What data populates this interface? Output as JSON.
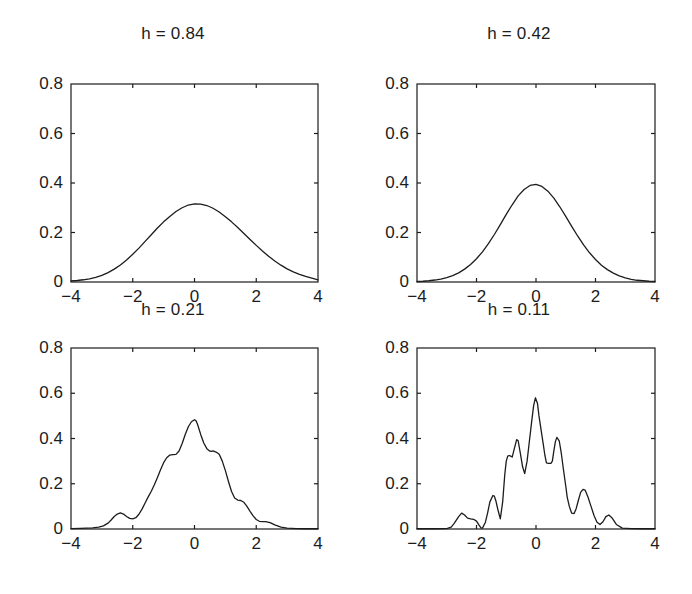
{
  "figure": {
    "width": 692,
    "height": 594,
    "background": "#ffffff",
    "axis_color": "#1c1c1c",
    "curve_color": "#1c1c1c"
  },
  "chart_data": [
    {
      "type": "line",
      "title": "h = 0.84",
      "xlabel": "",
      "ylabel": "",
      "xlim": [
        -4,
        4
      ],
      "ylim": [
        0,
        0.8
      ],
      "xticks": [
        -4,
        -2,
        0,
        2,
        4
      ],
      "xticklabels": [
        "−4",
        "−2",
        "0",
        "2",
        "4"
      ],
      "yticks": [
        0,
        0.2,
        0.4,
        0.6,
        0.8
      ],
      "yticklabels": [
        "0",
        "0.2",
        "0.4",
        "0.6",
        "0.8"
      ],
      "grid": false,
      "legend": null,
      "series": [
        {
          "name": "kde h=0.84",
          "x": [
            -4.0,
            -3.8,
            -3.6,
            -3.4,
            -3.2,
            -3.0,
            -2.8,
            -2.6,
            -2.4,
            -2.2,
            -2.0,
            -1.8,
            -1.6,
            -1.4,
            -1.2,
            -1.0,
            -0.8,
            -0.6,
            -0.4,
            -0.2,
            0.0,
            0.2,
            0.4,
            0.6,
            0.8,
            1.0,
            1.2,
            1.4,
            1.6,
            1.8,
            2.0,
            2.2,
            2.4,
            2.6,
            2.8,
            3.0,
            3.2,
            3.4,
            3.6,
            3.8,
            4.0
          ],
          "y": [
            0.004,
            0.006,
            0.009,
            0.013,
            0.019,
            0.027,
            0.038,
            0.052,
            0.069,
            0.089,
            0.112,
            0.137,
            0.164,
            0.191,
            0.218,
            0.243,
            0.265,
            0.285,
            0.3,
            0.311,
            0.316,
            0.315,
            0.309,
            0.298,
            0.283,
            0.264,
            0.243,
            0.22,
            0.196,
            0.172,
            0.148,
            0.125,
            0.104,
            0.085,
            0.068,
            0.053,
            0.041,
            0.031,
            0.023,
            0.016,
            0.009
          ]
        }
      ]
    },
    {
      "type": "line",
      "title": "h = 0.42",
      "xlabel": "",
      "ylabel": "",
      "xlim": [
        -4,
        4
      ],
      "ylim": [
        0,
        0.8
      ],
      "xticks": [
        -4,
        -2,
        0,
        2,
        4
      ],
      "xticklabels": [
        "−4",
        "−2",
        "0",
        "2",
        "4"
      ],
      "yticks": [
        0,
        0.2,
        0.4,
        0.6,
        0.8
      ],
      "yticklabels": [
        "0",
        "0.2",
        "0.4",
        "0.6",
        "0.8"
      ],
      "grid": false,
      "legend": null,
      "series": [
        {
          "name": "kde h=0.42",
          "x": [
            -4.0,
            -3.8,
            -3.6,
            -3.4,
            -3.2,
            -3.0,
            -2.8,
            -2.6,
            -2.4,
            -2.2,
            -2.0,
            -1.8,
            -1.6,
            -1.4,
            -1.2,
            -1.0,
            -0.8,
            -0.6,
            -0.4,
            -0.2,
            0.0,
            0.2,
            0.4,
            0.6,
            0.8,
            1.0,
            1.2,
            1.4,
            1.6,
            1.8,
            2.0,
            2.2,
            2.4,
            2.6,
            2.8,
            3.0,
            3.2,
            3.4,
            3.6,
            3.8,
            4.0
          ],
          "y": [
            0.002,
            0.003,
            0.005,
            0.008,
            0.012,
            0.018,
            0.026,
            0.037,
            0.052,
            0.071,
            0.094,
            0.122,
            0.155,
            0.192,
            0.232,
            0.273,
            0.312,
            0.348,
            0.374,
            0.39,
            0.394,
            0.386,
            0.367,
            0.339,
            0.304,
            0.265,
            0.225,
            0.186,
            0.15,
            0.118,
            0.091,
            0.068,
            0.05,
            0.036,
            0.025,
            0.017,
            0.011,
            0.007,
            0.005,
            0.003,
            0.002
          ]
        }
      ]
    },
    {
      "type": "line",
      "title": "h = 0.21",
      "xlabel": "",
      "ylabel": "",
      "xlim": [
        -4,
        4
      ],
      "ylim": [
        0,
        0.8
      ],
      "xticks": [
        -4,
        -2,
        0,
        2,
        4
      ],
      "xticklabels": [
        "−4",
        "−2",
        "0",
        "2",
        "4"
      ],
      "yticks": [
        0,
        0.2,
        0.4,
        0.6,
        0.8
      ],
      "yticklabels": [
        "0",
        "0.2",
        "0.4",
        "0.6",
        "0.8"
      ],
      "grid": false,
      "legend": null,
      "series": [
        {
          "name": "kde h=0.21",
          "x": [
            -4.0,
            -3.7,
            -3.5,
            -3.3,
            -3.1,
            -2.95,
            -2.8,
            -2.7,
            -2.6,
            -2.5,
            -2.4,
            -2.3,
            -2.2,
            -2.1,
            -2.0,
            -1.9,
            -1.8,
            -1.7,
            -1.6,
            -1.5,
            -1.4,
            -1.3,
            -1.2,
            -1.1,
            -1.0,
            -0.9,
            -0.8,
            -0.7,
            -0.6,
            -0.5,
            -0.4,
            -0.3,
            -0.2,
            -0.1,
            0.0,
            0.05,
            0.1,
            0.2,
            0.3,
            0.4,
            0.5,
            0.55,
            0.6,
            0.7,
            0.8,
            0.9,
            1.0,
            1.1,
            1.2,
            1.3,
            1.4,
            1.5,
            1.6,
            1.7,
            1.8,
            1.9,
            2.0,
            2.1,
            2.2,
            2.3,
            2.45,
            2.6,
            2.8,
            3.0,
            3.3,
            3.6,
            4.0
          ],
          "y": [
            0.002,
            0.003,
            0.004,
            0.005,
            0.008,
            0.014,
            0.026,
            0.04,
            0.055,
            0.066,
            0.071,
            0.066,
            0.055,
            0.047,
            0.045,
            0.05,
            0.065,
            0.088,
            0.115,
            0.142,
            0.167,
            0.196,
            0.228,
            0.262,
            0.293,
            0.315,
            0.327,
            0.329,
            0.33,
            0.345,
            0.378,
            0.418,
            0.452,
            0.474,
            0.483,
            0.478,
            0.462,
            0.418,
            0.38,
            0.355,
            0.344,
            0.343,
            0.345,
            0.34,
            0.33,
            0.3,
            0.258,
            0.21,
            0.166,
            0.137,
            0.128,
            0.126,
            0.118,
            0.1,
            0.078,
            0.058,
            0.042,
            0.034,
            0.033,
            0.033,
            0.028,
            0.018,
            0.008,
            0.004,
            0.002,
            0.001,
            0.001
          ]
        }
      ]
    },
    {
      "type": "line",
      "title": "h = 0.11",
      "xlabel": "",
      "ylabel": "",
      "xlim": [
        -4,
        4
      ],
      "ylim": [
        0,
        0.8
      ],
      "xticks": [
        -4,
        -2,
        0,
        2,
        4
      ],
      "xticklabels": [
        "−4",
        "−2",
        "0",
        "2",
        "4"
      ],
      "yticks": [
        0,
        0.2,
        0.4,
        0.6,
        0.8
      ],
      "yticklabels": [
        "0",
        "0.2",
        "0.4",
        "0.6",
        "0.8"
      ],
      "grid": false,
      "legend": null,
      "series": [
        {
          "name": "kde h=0.11",
          "x": [
            -4.0,
            -3.4,
            -3.0,
            -2.85,
            -2.75,
            -2.6,
            -2.5,
            -2.4,
            -2.3,
            -2.2,
            -2.1,
            -2.0,
            -1.92,
            -1.85,
            -1.8,
            -1.7,
            -1.62,
            -1.55,
            -1.45,
            -1.4,
            -1.35,
            -1.28,
            -1.2,
            -1.12,
            -1.05,
            -1.0,
            -0.95,
            -0.9,
            -0.85,
            -0.8,
            -0.72,
            -0.65,
            -0.6,
            -0.52,
            -0.45,
            -0.38,
            -0.3,
            -0.22,
            -0.15,
            -0.08,
            -0.02,
            0.05,
            0.1,
            0.18,
            0.25,
            0.3,
            0.35,
            0.42,
            0.5,
            0.55,
            0.6,
            0.65,
            0.7,
            0.78,
            0.85,
            0.92,
            1.0,
            1.05,
            1.12,
            1.2,
            1.28,
            1.35,
            1.42,
            1.5,
            1.58,
            1.65,
            1.75,
            1.85,
            1.95,
            2.05,
            2.15,
            2.25,
            2.35,
            2.45,
            2.55,
            2.7,
            2.9,
            3.2,
            3.6,
            4.0
          ],
          "y": [
            0.001,
            0.001,
            0.002,
            0.008,
            0.025,
            0.055,
            0.07,
            0.062,
            0.048,
            0.045,
            0.043,
            0.035,
            0.018,
            0.005,
            0.004,
            0.03,
            0.075,
            0.12,
            0.148,
            0.145,
            0.125,
            0.085,
            0.045,
            0.12,
            0.24,
            0.3,
            0.322,
            0.325,
            0.322,
            0.318,
            0.36,
            0.395,
            0.39,
            0.33,
            0.275,
            0.245,
            0.3,
            0.39,
            0.47,
            0.545,
            0.58,
            0.555,
            0.5,
            0.43,
            0.37,
            0.325,
            0.292,
            0.29,
            0.29,
            0.3,
            0.345,
            0.385,
            0.405,
            0.39,
            0.335,
            0.265,
            0.19,
            0.14,
            0.1,
            0.07,
            0.068,
            0.09,
            0.125,
            0.162,
            0.175,
            0.172,
            0.14,
            0.1,
            0.06,
            0.03,
            0.02,
            0.032,
            0.055,
            0.062,
            0.05,
            0.02,
            0.004,
            0.002,
            0.001,
            0.001
          ]
        }
      ]
    }
  ]
}
